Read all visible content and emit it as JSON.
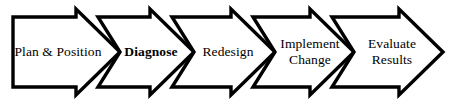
{
  "diagram": {
    "type": "process-flow-chevron",
    "title": "",
    "orientation": "horizontal",
    "stage_count": 5,
    "style": {
      "background_color": "#ffffff",
      "stroke_color": "#000000",
      "fill_color": "#ffffff",
      "stroke_width": 3.2,
      "text_color": "#000000"
    },
    "geometry": {
      "width": 455,
      "height": 104,
      "body_top": 17,
      "body_bottom": 87,
      "apex_top": 9,
      "apex_bottom": 95,
      "left_edge": 13,
      "boundaries": [
        98,
        172,
        253,
        332,
        443
      ],
      "notch_depth": 22
    },
    "stages": [
      {
        "id": "plan-position",
        "label": "Plan & Position",
        "emphasis": "regular",
        "lines": [
          "Plan & Position"
        ],
        "x_start": 13,
        "x_end": 98,
        "label_center_x": 57,
        "label_center_y": 52
      },
      {
        "id": "diagnose",
        "label": "Diagnose",
        "emphasis": "bold",
        "lines": [
          "Diagnose"
        ],
        "x_start": 98,
        "x_end": 172,
        "label_center_x": 151,
        "label_center_y": 52
      },
      {
        "id": "redesign",
        "label": "Redesign",
        "emphasis": "regular",
        "lines": [
          "Redesign"
        ],
        "x_start": 172,
        "x_end": 253,
        "label_center_x": 228,
        "label_center_y": 52
      },
      {
        "id": "implement-change",
        "label": "Implement Change",
        "emphasis": "regular",
        "lines": [
          "Implement",
          "Change"
        ],
        "x_start": 253,
        "x_end": 332,
        "label_center_x": 310,
        "label_center_y": 52
      },
      {
        "id": "evaluate-results",
        "label": "Evaluate Results",
        "emphasis": "regular",
        "lines": [
          "Evaluate",
          "Results"
        ],
        "x_start": 332,
        "x_end": 443,
        "label_center_x": 392,
        "label_center_y": 52
      }
    ],
    "labels": {
      "stage_1": "Plan & Position",
      "stage_2": "Diagnose",
      "stage_3": "Redesign",
      "stage_4": "Implement\nChange",
      "stage_5": "Evaluate\nResults"
    }
  }
}
